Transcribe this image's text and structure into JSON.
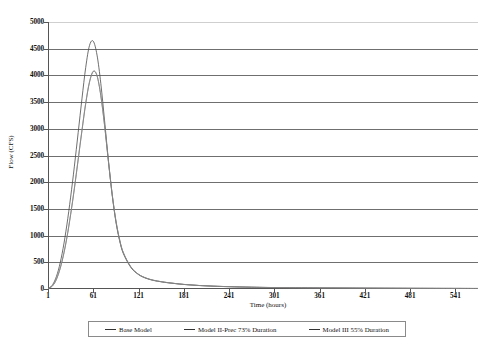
{
  "chart_data": {
    "type": "line",
    "title": "",
    "xlabel": "Time (hours)",
    "ylabel": "Flow (CFS)",
    "xlim": [
      1,
      571
    ],
    "ylim": [
      0,
      5000
    ],
    "grid": true,
    "legend_position": "bottom",
    "xticks": [
      "1",
      "61",
      "121",
      "181",
      "241",
      "301",
      "361",
      "421",
      "481",
      "541"
    ],
    "xtick_values": [
      1,
      61,
      121,
      181,
      241,
      301,
      361,
      421,
      481,
      541
    ],
    "yticks": [
      "0",
      "500",
      "1000",
      "1500",
      "2000",
      "2500",
      "3000",
      "3500",
      "4000",
      "4500",
      "5000"
    ],
    "ytick_values": [
      0,
      500,
      1000,
      1500,
      2000,
      2500,
      3000,
      3500,
      4000,
      4500,
      5000
    ],
    "x": [
      1,
      6,
      11,
      16,
      21,
      26,
      31,
      36,
      41,
      46,
      51,
      56,
      61,
      66,
      71,
      76,
      81,
      86,
      91,
      96,
      101,
      111,
      121,
      131,
      141,
      151,
      161,
      181,
      201,
      221,
      241,
      271,
      301,
      361,
      421,
      481,
      541,
      571
    ],
    "series": [
      {
        "name": "Base Model",
        "color": "#4a4a4a",
        "peak_value": 4650,
        "peak_time": 52,
        "values": [
          10,
          60,
          190,
          420,
          760,
          1200,
          1720,
          2300,
          2930,
          3560,
          4150,
          4560,
          4640,
          4380,
          3850,
          3150,
          2420,
          1770,
          1260,
          900,
          660,
          400,
          270,
          200,
          160,
          135,
          115,
          85,
          65,
          52,
          43,
          33,
          27,
          20,
          16,
          13,
          11,
          10
        ]
      },
      {
        "name": "Model II-Prec 73% Duration",
        "color": "#6d6d6d",
        "peak_value": 4080,
        "peak_time": 55,
        "values": [
          8,
          45,
          145,
          330,
          600,
          955,
          1390,
          1880,
          2420,
          2960,
          3470,
          3870,
          4070,
          3990,
          3620,
          3060,
          2400,
          1780,
          1280,
          920,
          675,
          410,
          275,
          205,
          163,
          137,
          117,
          86,
          66,
          53,
          44,
          34,
          27,
          20,
          16,
          13,
          11,
          10
        ]
      },
      {
        "name": "Model III 55% Duration",
        "color": "#8a8a8a",
        "peak_value": 4085,
        "peak_time": 55,
        "values": [
          8,
          46,
          148,
          335,
          608,
          965,
          1402,
          1893,
          2435,
          2975,
          3485,
          3882,
          4080,
          3998,
          3628,
          3066,
          2405,
          1784,
          1283,
          922,
          677,
          411,
          276,
          206,
          164,
          138,
          118,
          86,
          66,
          53,
          44,
          34,
          27,
          20,
          16,
          13,
          11,
          10
        ]
      }
    ]
  },
  "legend": {
    "items": [
      {
        "label": "Base Model"
      },
      {
        "label": "Model II-Prec 73% Duration"
      },
      {
        "label": "Model III 55% Duration"
      }
    ]
  }
}
